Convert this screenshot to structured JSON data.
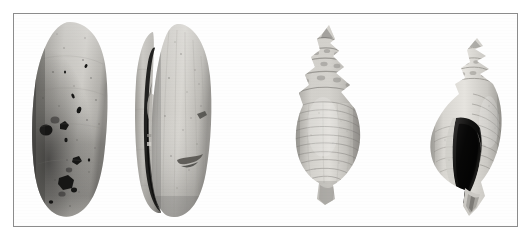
{
  "plate": {
    "title": "Mollusc shell specimen plate",
    "background_color": "#ffffff",
    "frame_color": "#8c8c8c",
    "frame_style": "thin single rule rectangle",
    "color_mode": "grayscale",
    "caption": "",
    "scale_bar": "",
    "labels_visible": false
  },
  "specimens": [
    {
      "index": 1,
      "data_name": "specimen-1-bivalve-exterior",
      "common_name": "bivalve shell",
      "view": "exterior / dorsal view",
      "orientation": "vertical, umbo up",
      "description": "Elongate oval bivalve valve, medium grey, heavily pitted with dark boring holes concentrated on the lower left half; darker shading down the left margin.",
      "tone_light": "#cfcdc8",
      "tone_mid": "#a8a6a1",
      "tone_dark": "#5d5b58",
      "pit_color": "#1d1c1b",
      "position": {
        "x": 28,
        "y": 19,
        "w": 82,
        "h": 200
      }
    },
    {
      "index": 2,
      "data_name": "specimen-2-bivalve-interior",
      "common_name": "bivalve shell",
      "view": "articulated / hinge view",
      "orientation": "vertical, umbo up",
      "description": "Same bivalve seen with both valves slightly open; a deep black crevice runs down the left side between the valves, right valve pale grey with faint radial ribs and two dark smears.",
      "tone_light": "#d6d4cf",
      "tone_mid": "#aeaca7",
      "tone_dark": "#4a4947",
      "pit_color": "#171716",
      "position": {
        "x": 124,
        "y": 19,
        "w": 92,
        "h": 200
      }
    },
    {
      "index": 3,
      "data_name": "specimen-3-gastropod-dorsal",
      "common_name": "gastropod (whelk) shell",
      "view": "dorsal / abapertural view",
      "orientation": "vertical, spire up",
      "description": "High-spired gastropod with stepped, nodular whorl shoulders and strong spiral cords across the inflated body whorl; overall pale grey with banded shading.",
      "tone_light": "#dedcd7",
      "tone_mid": "#b5b3ae",
      "tone_dark": "#7a7874",
      "pit_color": "#555350",
      "position": {
        "x": 288,
        "y": 22,
        "w": 76,
        "h": 184
      }
    },
    {
      "index": 4,
      "data_name": "specimen-4-gastropod-ventral",
      "common_name": "gastropod (whelk) shell",
      "view": "ventral / apertural view",
      "orientation": "vertical, spire up, aperture facing viewer",
      "description": "Same gastropod turned to show the large dark aperture and a long narrow siphonal canal extending below; spire whorls visible at top with spiral ribbing on the right flank.",
      "tone_light": "#e2e0dc",
      "tone_mid": "#bab8b3",
      "tone_dark": "#6f6d69",
      "pit_color": "#131312",
      "position": {
        "x": 424,
        "y": 35,
        "w": 82,
        "h": 182
      }
    }
  ]
}
